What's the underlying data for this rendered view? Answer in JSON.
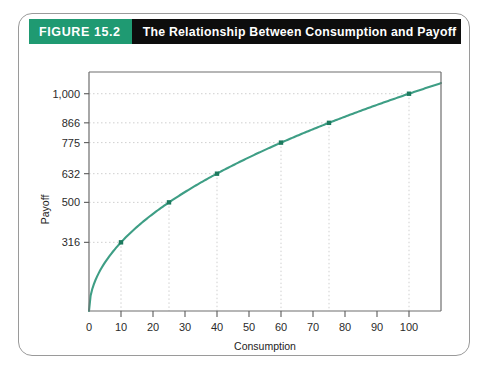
{
  "figure": {
    "badge_label": "FIGURE 15.2",
    "title": "The Relationship Between Consumption and Payoff",
    "badge_color": "#1f9a72",
    "header_bg": "#0d0d0d",
    "frame_border": "#9a9a9a"
  },
  "chart_data": {
    "type": "line",
    "title": "The Relationship Between Consumption and Payoff",
    "xlabel": "Consumption",
    "ylabel": "Payoff",
    "xlim": [
      0,
      110
    ],
    "ylim": [
      0,
      1100
    ],
    "grid": true,
    "legend": "none",
    "curve_color": "#3e9e85",
    "marker_color": "#1d7a5e",
    "gridline_color": "#cfcfcf",
    "x_ticks": [
      0,
      10,
      20,
      30,
      40,
      50,
      60,
      70,
      80,
      90,
      100
    ],
    "x_tick_labels": [
      "0",
      "10",
      "20",
      "30",
      "40",
      "50",
      "60",
      "70",
      "80",
      "90",
      "100"
    ],
    "y_ticks": [
      316,
      500,
      632,
      775,
      866,
      1000
    ],
    "y_tick_labels": [
      "316",
      "500",
      "632",
      "775",
      "866",
      "1,000"
    ],
    "series": [
      {
        "name": "Payoff",
        "function": "payoff = 100 * sqrt(consumption)",
        "marked_points": [
          {
            "x": 10,
            "y": 316
          },
          {
            "x": 25,
            "y": 500
          },
          {
            "x": 40,
            "y": 632
          },
          {
            "x": 60,
            "y": 775
          },
          {
            "x": 75,
            "y": 866
          },
          {
            "x": 100,
            "y": 1000
          }
        ]
      }
    ]
  }
}
